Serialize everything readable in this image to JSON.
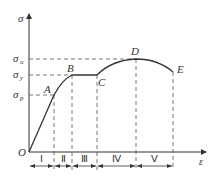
{
  "diagram": {
    "type": "stress-strain curve",
    "axes": {
      "y_label": "σ",
      "x_label": "ε",
      "origin_label": "O"
    },
    "stress_levels": [
      {
        "id": "u",
        "label": "σ",
        "sub": "u",
        "y": 59
      },
      {
        "id": "y",
        "label": "σ",
        "sub": "y",
        "y": 75
      },
      {
        "id": "p",
        "label": "σ",
        "sub": "p",
        "y": 95
      }
    ],
    "points": [
      {
        "id": "A",
        "label": "A",
        "x": 54,
        "y": 95
      },
      {
        "id": "B",
        "label": "B",
        "x": 72,
        "y": 75
      },
      {
        "id": "C",
        "label": "C",
        "x": 97,
        "y": 75
      },
      {
        "id": "D",
        "label": "D",
        "x": 136,
        "y": 59
      },
      {
        "id": "E",
        "label": "E",
        "x": 173,
        "y": 72
      }
    ],
    "stages": [
      {
        "label": "Ⅰ",
        "x_start": 29,
        "x_end": 54
      },
      {
        "label": "Ⅱ",
        "x_start": 54,
        "x_end": 72
      },
      {
        "label": "Ⅲ",
        "x_start": 72,
        "x_end": 97
      },
      {
        "label": "Ⅳ",
        "x_start": 97,
        "x_end": 136
      },
      {
        "label": "Ⅴ",
        "x_start": 136,
        "x_end": 173
      }
    ],
    "colors": {
      "line": "#333333",
      "dash": "#555555"
    }
  }
}
